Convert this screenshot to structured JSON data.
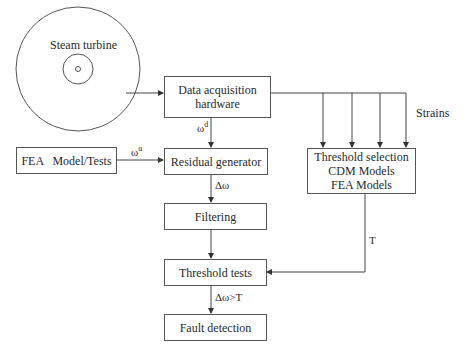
{
  "diagram": {
    "turbine_label": "Steam turbine",
    "boxes": {
      "daq": [
        "Data acquisition",
        "hardware"
      ],
      "fea": "FEA   Model/Tests",
      "residual": "Residual generator",
      "filtering": "Filtering",
      "threshold_tests": "Threshold tests",
      "fault": "Fault detection",
      "threshold_selection": [
        "Threshold selection",
        "CDM Models",
        "FEA Models"
      ]
    },
    "labels": {
      "omega_d_base": "ω",
      "omega_d_sup": "d",
      "omega_u_base": "ω",
      "omega_u_sup": "u",
      "delta_omega": "Δω",
      "strains": "Strains",
      "T": "T",
      "condition": "Δω>T"
    }
  }
}
